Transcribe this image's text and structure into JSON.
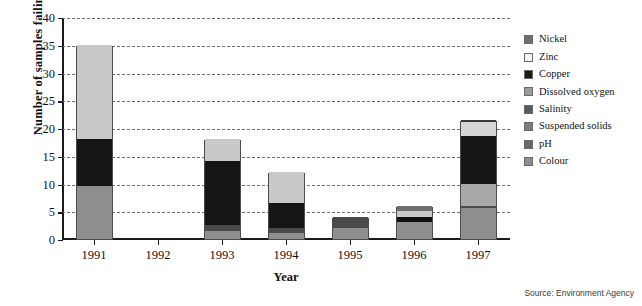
{
  "chart_data": {
    "type": "bar",
    "subtype": "stacked-bar",
    "title": "",
    "xlabel": "Year",
    "ylabel": "Number of samples failing",
    "categories": [
      "1991",
      "1992",
      "1993",
      "1994",
      "1995",
      "1996",
      "1997"
    ],
    "ylim": [
      0,
      40
    ],
    "ytick_step": 5,
    "yticks": [
      0,
      5,
      10,
      15,
      20,
      25,
      30,
      35,
      40
    ],
    "grid": "horizontal-dashed",
    "legend_position": "right",
    "series": [
      {
        "name": "Nickel",
        "color": "#6e6e6e",
        "values": [
          0,
          0,
          0,
          0,
          0,
          1,
          0
        ]
      },
      {
        "name": "Zinc",
        "color": "#f2f2f2",
        "values": [
          0,
          0,
          0,
          0,
          0,
          0,
          0
        ]
      },
      {
        "name": "Copper",
        "color": "#111111",
        "values": [
          0,
          0,
          0,
          0,
          0,
          1,
          0.6
        ]
      },
      {
        "name": "Dissolved oxygen",
        "color": "#c9c9c9",
        "values": [
          17,
          0,
          4,
          5.5,
          0,
          1,
          3
        ]
      },
      {
        "name": "Salinity",
        "color": "#151515",
        "values": [
          8.5,
          0,
          11.5,
          4.5,
          0,
          0,
          8.5
        ]
      },
      {
        "name": "Suspended solids",
        "color": "#4a4a4a",
        "values": [
          0,
          0,
          1,
          1,
          2,
          0,
          0.5
        ]
      },
      {
        "name": "pH",
        "color": "#5f5f5f",
        "values": [
          0,
          0,
          0,
          0,
          0,
          0,
          0
        ]
      },
      {
        "name": "Colour",
        "color": "#8e8e8e",
        "values": [
          9.5,
          0,
          1.5,
          1,
          2,
          3,
          5.5
        ]
      }
    ],
    "totals": [
      35,
      0,
      18,
      12,
      4,
      6,
      21.5
    ],
    "stacks": [
      {
        "category": "1991",
        "total": 35,
        "segments": [
          {
            "series": "Colour",
            "start": 0,
            "end": 9.5,
            "color": "#8e8e8e"
          },
          {
            "series": "Salinity",
            "start": 9.5,
            "end": 18,
            "color": "#151515"
          },
          {
            "series": "Dissolved oxygen",
            "start": 18,
            "end": 35,
            "color": "#c9c9c9"
          }
        ]
      },
      {
        "category": "1992",
        "total": 0,
        "segments": []
      },
      {
        "category": "1993",
        "total": 18,
        "segments": [
          {
            "series": "Colour",
            "start": 0,
            "end": 1.5,
            "color": "#8e8e8e"
          },
          {
            "series": "Suspended solids",
            "start": 1.5,
            "end": 2.5,
            "color": "#4a4a4a"
          },
          {
            "series": "Salinity",
            "start": 2.5,
            "end": 14,
            "color": "#151515"
          },
          {
            "series": "Dissolved oxygen",
            "start": 14,
            "end": 18,
            "color": "#c9c9c9"
          }
        ]
      },
      {
        "category": "1994",
        "total": 12,
        "segments": [
          {
            "series": "Colour",
            "start": 0,
            "end": 1,
            "color": "#8e8e8e"
          },
          {
            "series": "Suspended solids",
            "start": 1,
            "end": 2,
            "color": "#4a4a4a"
          },
          {
            "series": "Salinity",
            "start": 2,
            "end": 6.5,
            "color": "#151515"
          },
          {
            "series": "Dissolved oxygen",
            "start": 6.5,
            "end": 12,
            "color": "#c9c9c9"
          }
        ]
      },
      {
        "category": "1995",
        "total": 4,
        "segments": [
          {
            "series": "Colour",
            "start": 0,
            "end": 2,
            "color": "#8e8e8e"
          },
          {
            "series": "Suspended solids",
            "start": 2,
            "end": 4,
            "color": "#4a4a4a"
          }
        ]
      },
      {
        "category": "1996",
        "total": 6,
        "segments": [
          {
            "series": "Colour",
            "start": 0,
            "end": 3,
            "color": "#8e8e8e"
          },
          {
            "series": "Copper",
            "start": 3,
            "end": 4,
            "color": "#111111"
          },
          {
            "series": "Dissolved oxygen",
            "start": 4,
            "end": 5,
            "color": "#c9c9c9"
          },
          {
            "series": "Nickel",
            "start": 5,
            "end": 6,
            "color": "#6e6e6e"
          }
        ]
      },
      {
        "category": "1997",
        "total": 21.5,
        "segments": [
          {
            "series": "Colour",
            "start": 0,
            "end": 5.5,
            "color": "#8e8e8e"
          },
          {
            "series": "Suspended solids",
            "start": 5.5,
            "end": 6,
            "color": "#4a4a4a"
          },
          {
            "series": "Dissolved oxygen",
            "start": 6,
            "end": 10,
            "color": "#a8a8a8"
          },
          {
            "series": "Salinity",
            "start": 10,
            "end": 18.5,
            "color": "#151515"
          },
          {
            "series": "Zinc",
            "start": 18.5,
            "end": 21,
            "color": "#d5d5d5"
          },
          {
            "series": "Copper",
            "start": 21,
            "end": 21.5,
            "color": "#3b3b3b"
          }
        ]
      }
    ]
  },
  "legend": {
    "items": [
      {
        "label": "Nickel",
        "color": "#6e6e6e"
      },
      {
        "label": "Zinc",
        "color": "#f4f4f4"
      },
      {
        "label": "Copper",
        "color": "#1a1a1a"
      },
      {
        "label": "Dissolved oxygen",
        "color": "#9a9a9a"
      },
      {
        "label": "Salinity",
        "color": "#5a5a5a"
      },
      {
        "label": "Suspended solids",
        "color": "#7d7d7d"
      },
      {
        "label": "pH",
        "color": "#686868"
      },
      {
        "label": "Colour",
        "color": "#8e8e8e"
      }
    ]
  },
  "source": {
    "text": "Source: Environment Agency"
  }
}
